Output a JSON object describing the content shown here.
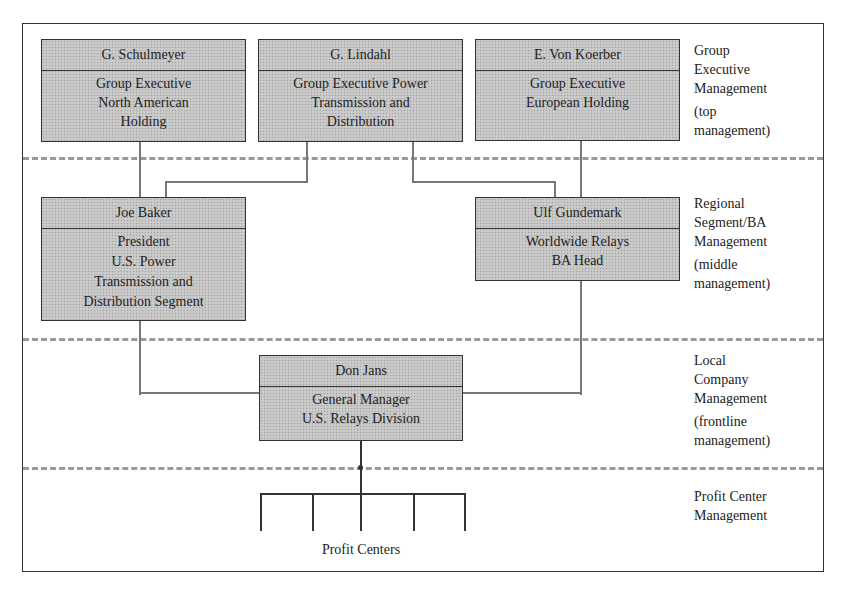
{
  "diagram": {
    "type": "organizational-chart",
    "levels": [
      {
        "label_lines": [
          "Group",
          "Executive",
          "Management"
        ],
        "sub_lines": [
          "(top",
          "management)"
        ]
      },
      {
        "label_lines": [
          "Regional",
          "Segment/BA",
          "Management"
        ],
        "sub_lines": [
          "(middle",
          "management)"
        ]
      },
      {
        "label_lines": [
          "Local",
          "Company",
          "Management"
        ],
        "sub_lines": [
          "(frontline",
          "management)"
        ]
      },
      {
        "label_lines": [
          "Profit Center",
          "Management"
        ],
        "sub_lines": []
      }
    ],
    "nodes": {
      "schulmeyer": {
        "name": "G. Schulmeyer",
        "title_lines": [
          "Group Executive",
          "North American",
          "Holding"
        ]
      },
      "lindahl": {
        "name": "G. Lindahl",
        "title_lines": [
          "Group Executive Power",
          "Transmission and",
          "Distribution"
        ]
      },
      "von_koerber": {
        "name": "E. Von Koerber",
        "title_lines": [
          "Group Executive",
          "European Holding"
        ]
      },
      "baker": {
        "name": "Joe Baker",
        "title_lines": [
          "President",
          "U.S. Power",
          "Transmission and",
          "Distribution Segment"
        ]
      },
      "gundemark": {
        "name": "Ulf Gundemark",
        "title_lines": [
          "Worldwide Relays",
          "BA Head"
        ]
      },
      "jans": {
        "name": "Don Jans",
        "title_lines": [
          "General Manager",
          "U.S. Relays Division"
        ]
      }
    },
    "profit_centers_label": "Profit Centers",
    "profit_center_count": 5,
    "edges": [
      [
        "schulmeyer",
        "baker"
      ],
      [
        "lindahl",
        "baker"
      ],
      [
        "lindahl",
        "gundemark"
      ],
      [
        "von_koerber",
        "gundemark"
      ],
      [
        "baker",
        "jans"
      ],
      [
        "gundemark",
        "jans"
      ],
      [
        "jans",
        "profit_centers"
      ]
    ],
    "colors": {
      "box_fill": "#c6c6c6",
      "box_border": "#333333",
      "connector": "#777777",
      "divider_dash": "#9a9a9a"
    }
  }
}
